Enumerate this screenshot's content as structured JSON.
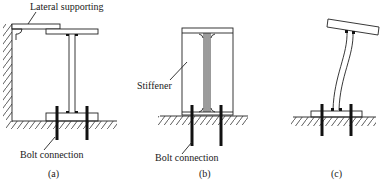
{
  "figure": {
    "panels": [
      {
        "id": "a",
        "caption": "(a)",
        "labels": {
          "top": "Lateral supporting",
          "bottom": "Bolt connection"
        }
      },
      {
        "id": "b",
        "caption": "(b)",
        "labels": {
          "side": "Stiffener",
          "bottom": "Bolt connection"
        }
      },
      {
        "id": "c",
        "caption": "(c)",
        "labels": {}
      }
    ]
  }
}
